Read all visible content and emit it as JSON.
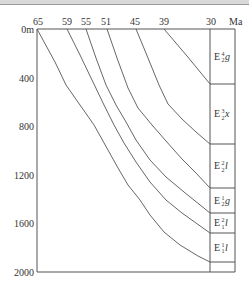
{
  "chart_data": {
    "type": "line",
    "title": "",
    "xlabel": "Ma",
    "ylabel": "Depth (m)",
    "x_axis_position": "top",
    "x_ticks": [
      "65",
      "59",
      "55",
      "51",
      "45",
      "39",
      "30"
    ],
    "y_ticks": [
      "0m",
      "400",
      "800",
      "1200",
      "1600",
      "2000"
    ],
    "ylim": [
      0,
      2000
    ],
    "xlim": [
      65,
      30
    ],
    "series": [
      {
        "name": "65 Ma horizon (E1 1 l base)",
        "start_age": 65,
        "points": [
          [
            65,
            0
          ],
          [
            60,
            450
          ],
          [
            55,
            780
          ],
          [
            50,
            1130
          ],
          [
            45,
            1480
          ],
          [
            40,
            1640
          ],
          [
            30,
            1920
          ]
        ]
      },
      {
        "name": "59 Ma horizon",
        "start_age": 59,
        "points": [
          [
            59,
            0
          ],
          [
            55,
            650
          ],
          [
            50,
            1020
          ],
          [
            45,
            1330
          ],
          [
            40,
            1480
          ],
          [
            30,
            1680
          ]
        ]
      },
      {
        "name": "55 Ma horizon",
        "start_age": 55,
        "points": [
          [
            55,
            0
          ],
          [
            52,
            580
          ],
          [
            50,
            790
          ],
          [
            45,
            1150
          ],
          [
            40,
            1340
          ],
          [
            30,
            1520
          ]
        ]
      },
      {
        "name": "51 Ma horizon",
        "start_age": 51,
        "points": [
          [
            51,
            0
          ],
          [
            48,
            630
          ],
          [
            45,
            980
          ],
          [
            40,
            1200
          ],
          [
            30,
            1310
          ]
        ]
      },
      {
        "name": "45 Ma horizon",
        "start_age": 45,
        "points": [
          [
            45,
            0
          ],
          [
            42,
            580
          ],
          [
            40,
            770
          ],
          [
            30,
            950
          ]
        ]
      },
      {
        "name": "39 Ma horizon",
        "start_age": 39,
        "points": [
          [
            39,
            0
          ],
          [
            30,
            450
          ]
        ]
      }
    ],
    "formations": [
      {
        "label": "E",
        "sub": "2",
        "sup": "4",
        "suffix": "g",
        "top_depth": 0,
        "bottom_depth": 450
      },
      {
        "label": "E",
        "sub": "2",
        "sup": "3",
        "suffix": "x",
        "top_depth": 450,
        "bottom_depth": 950
      },
      {
        "label": "E",
        "sub": "2",
        "sup": "2",
        "suffix": "l",
        "top_depth": 950,
        "bottom_depth": 1310
      },
      {
        "label": "E",
        "sub": "2",
        "sup": "1",
        "suffix": "g",
        "top_depth": 1310,
        "bottom_depth": 1520
      },
      {
        "label": "E",
        "sub": "1",
        "sup": "2",
        "suffix": "l",
        "top_depth": 1520,
        "bottom_depth": 1680
      },
      {
        "label": "E",
        "sub": "1",
        "sup": "1",
        "suffix": "l",
        "top_depth": 1680,
        "bottom_depth": 1920
      }
    ],
    "grid": false,
    "legend": "none"
  },
  "axis": {
    "unit_label": "Ma",
    "top_ticks": [
      {
        "label": "65",
        "x": 38
      },
      {
        "label": "59",
        "x": 67
      },
      {
        "label": "55",
        "x": 86
      },
      {
        "label": "51",
        "x": 106
      },
      {
        "label": "45",
        "x": 135
      },
      {
        "label": "39",
        "x": 164
      },
      {
        "label": "30",
        "x": 211
      }
    ],
    "left_ticks": [
      {
        "label": "0m",
        "y": 29
      },
      {
        "label": "400",
        "y": 78
      },
      {
        "label": "800",
        "y": 126
      },
      {
        "label": "1200",
        "y": 175
      },
      {
        "label": "1600",
        "y": 223
      },
      {
        "label": "2000",
        "y": 272
      }
    ]
  },
  "formation_labels": [
    {
      "main": "E",
      "sup": "4",
      "sub": "2",
      "suffix": "g"
    },
    {
      "main": "E",
      "sup": "3",
      "sub": "2",
      "suffix": "x"
    },
    {
      "main": "E",
      "sup": "2",
      "sub": "2",
      "suffix": "l"
    },
    {
      "main": "E",
      "sup": "1",
      "sub": "2",
      "suffix": "g"
    },
    {
      "main": "E",
      "sup": "2",
      "sub": "1",
      "suffix": "l"
    },
    {
      "main": "E",
      "sup": "1",
      "sub": "1",
      "suffix": "l"
    }
  ]
}
